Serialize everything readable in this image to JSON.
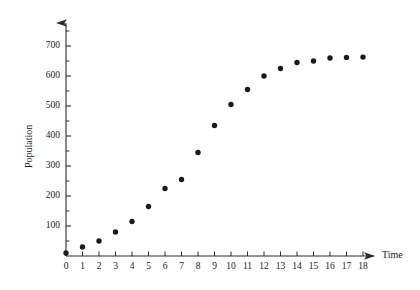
{
  "chart_data": {
    "type": "scatter",
    "title": "",
    "xlabel": "Time",
    "ylabel": "Population",
    "x": [
      0,
      1,
      2,
      3,
      4,
      5,
      6,
      7,
      8,
      9,
      10,
      11,
      12,
      13,
      14,
      15,
      16,
      17,
      18
    ],
    "values": [
      10,
      30,
      50,
      80,
      115,
      165,
      225,
      255,
      345,
      435,
      505,
      555,
      600,
      625,
      645,
      650,
      660,
      662,
      663
    ],
    "xlim": [
      0,
      18
    ],
    "ylim": [
      0,
      760
    ],
    "x_ticks": [
      0,
      1,
      2,
      3,
      4,
      5,
      6,
      7,
      8,
      9,
      10,
      11,
      12,
      13,
      14,
      15,
      16,
      17,
      18
    ],
    "x_tick_labels": [
      "0",
      "1",
      "2",
      "3",
      "4",
      "5",
      "6",
      "7",
      "8",
      "9",
      "10",
      "11",
      "12",
      "13",
      "14",
      "15",
      "16",
      "17",
      "18"
    ],
    "y_ticks": [
      100,
      200,
      300,
      400,
      500,
      600,
      700
    ],
    "y_tick_labels": [
      "100",
      "200",
      "300",
      "400",
      "500",
      "600",
      "700"
    ],
    "y_minor_ticks": [
      50,
      150,
      250,
      350,
      450,
      550,
      650,
      750
    ],
    "grid": false,
    "legend": "none",
    "marker": "filled-circle",
    "marker_color": "#1a1a1a",
    "axis_color": "#2b2b2b",
    "axis_style": "arrow-tipped"
  },
  "axes": {
    "x_title": "Time",
    "y_title": "Population"
  }
}
